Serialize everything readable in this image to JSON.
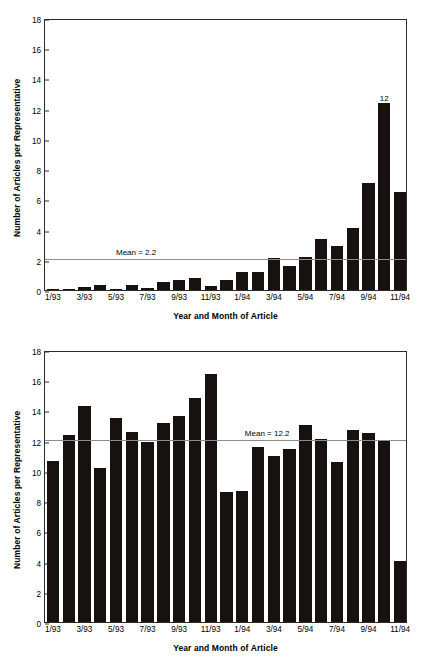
{
  "chart_data": [
    {
      "type": "bar",
      "title": "Campaign Coverage",
      "xlabel": "Year and Month of Article",
      "ylabel": "Number of Articles per Representative",
      "ylim": [
        0,
        18
      ],
      "yticks": [
        0,
        2,
        4,
        6,
        8,
        10,
        12,
        14,
        16,
        18
      ],
      "grid": false,
      "legend": "none",
      "categories": [
        "1/93",
        "2/93",
        "3/93",
        "4/93",
        "5/93",
        "6/93",
        "7/93",
        "8/93",
        "9/93",
        "10/93",
        "11/93",
        "12/93",
        "1/94",
        "2/94",
        "3/94",
        "4/94",
        "5/94",
        "6/94",
        "7/94",
        "8/94",
        "9/94",
        "10/94",
        "11/94"
      ],
      "tick_labels": [
        "1/93",
        "3/93",
        "5/93",
        "7/93",
        "9/93",
        "11/93",
        "1/94",
        "3/94",
        "5/94",
        "7/94",
        "9/94",
        "11/94"
      ],
      "values": [
        0.05,
        0.05,
        0.2,
        0.3,
        0.1,
        0.3,
        0.15,
        0.5,
        0.65,
        0.8,
        0.25,
        0.65,
        1.2,
        1.2,
        2.1,
        1.6,
        2.2,
        3.4,
        2.9,
        4.1,
        7.1,
        12.4,
        6.5
      ],
      "mean": 2.2,
      "mean_label": "Mean = 2.2",
      "annotations": [
        {
          "label": "12",
          "category": "10/94",
          "value": 12.4
        }
      ]
    },
    {
      "type": "bar",
      "title": "Noncampaign Coverage",
      "xlabel": "Year and Month of Article",
      "ylabel": "Number of Articles per Representative",
      "ylim": [
        0,
        18
      ],
      "yticks": [
        0,
        2,
        4,
        6,
        8,
        10,
        12,
        14,
        16,
        18
      ],
      "grid": false,
      "legend": "none",
      "categories": [
        "1/93",
        "2/93",
        "3/93",
        "4/93",
        "5/93",
        "6/93",
        "7/93",
        "8/93",
        "9/93",
        "10/93",
        "11/93",
        "12/93",
        "1/94",
        "2/94",
        "3/94",
        "4/94",
        "5/94",
        "6/94",
        "7/94",
        "8/94",
        "9/94",
        "10/94",
        "11/94"
      ],
      "tick_labels": [
        "1/93",
        "3/93",
        "5/93",
        "7/93",
        "9/93",
        "11/93",
        "1/94",
        "3/94",
        "5/94",
        "7/94",
        "9/94",
        "11/94"
      ],
      "values": [
        10.65,
        12.35,
        14.3,
        10.2,
        13.5,
        12.55,
        11.9,
        13.2,
        13.65,
        14.85,
        16.4,
        8.6,
        8.65,
        11.55,
        11.0,
        11.45,
        13.05,
        12.1,
        10.6,
        12.7,
        12.5,
        12.05,
        4.05
      ],
      "mean": 12.2,
      "mean_label": "Mean = 12.2",
      "annotations": []
    }
  ]
}
